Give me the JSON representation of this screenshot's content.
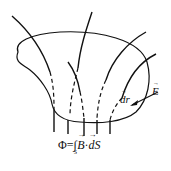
{
  "diagram": {
    "type": "magnetic flux surface diagram",
    "labels": {
      "dr": "dr",
      "E": "E"
    },
    "formula": {
      "lhs": "Φ=",
      "integral": "∫",
      "subscript": "S",
      "B": "B",
      "dot": "·",
      "dS": "dS"
    },
    "colors": {
      "stroke": "#111111",
      "background": "#ffffff"
    }
  }
}
